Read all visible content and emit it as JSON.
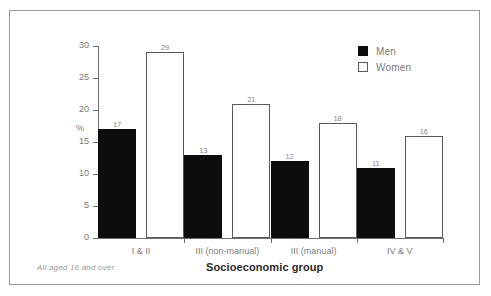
{
  "top_cut_text": "",
  "footnote": "All aged 16 and over",
  "legend": {
    "men_label": "Men",
    "women_label": "Women"
  },
  "axis": {
    "y_unit_label": "%",
    "x_title": "Socioeconomic group"
  },
  "chart_data": {
    "type": "bar",
    "title": "",
    "xlabel": "Socioeconomic group",
    "ylabel": "%",
    "ylim": [
      0,
      30
    ],
    "yticks": [
      0,
      5,
      10,
      15,
      20,
      25,
      30
    ],
    "ytick_labels": [
      "0",
      "5",
      "10",
      "15",
      "20",
      "25",
      "30"
    ],
    "grid": false,
    "legend_position": "top-right",
    "categories": [
      "I & II",
      "III (non-manual)",
      "III (manual)",
      "IV & V"
    ],
    "series": [
      {
        "name": "Men",
        "color": "#0d0d0d",
        "values": [
          17,
          13,
          12,
          11
        ]
      },
      {
        "name": "Women",
        "color": "#ffffff",
        "values": [
          29,
          21,
          18,
          16
        ]
      }
    ],
    "annotations": [
      "All aged 16 and over"
    ]
  }
}
